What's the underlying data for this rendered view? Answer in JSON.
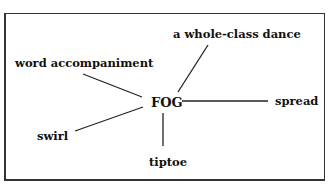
{
  "diagram": {
    "center": {
      "label": "FOG"
    },
    "nodes": [
      {
        "id": "word",
        "label": "word accompaniment"
      },
      {
        "id": "dance",
        "label": "a whole-class dance"
      },
      {
        "id": "spread",
        "label": "spread"
      },
      {
        "id": "swirl",
        "label": "swirl"
      },
      {
        "id": "tiptoe",
        "label": "tiptoe"
      }
    ],
    "edges": [
      {
        "from": "FOG",
        "to": "word accompaniment"
      },
      {
        "from": "FOG",
        "to": "a whole-class dance"
      },
      {
        "from": "FOG",
        "to": "spread"
      },
      {
        "from": "FOG",
        "to": "swirl"
      },
      {
        "from": "FOG",
        "to": "tiptoe"
      }
    ],
    "colors": {
      "line": "#222222",
      "border": "#333333",
      "background": "#ffffff"
    }
  }
}
